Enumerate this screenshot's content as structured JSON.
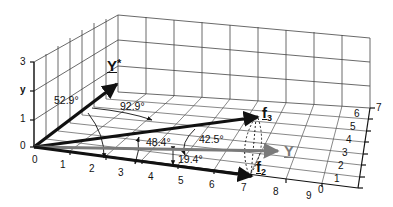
{
  "figure": {
    "type": "3d-vector-diagram",
    "y_axis": {
      "label": "y",
      "ticks": [
        "0",
        "1",
        "3"
      ]
    },
    "x_axis": {
      "ticks": [
        "0",
        "1",
        "2",
        "3",
        "4",
        "5",
        "6",
        "7",
        "8",
        "9"
      ]
    },
    "z_axis": {
      "ticks": [
        "0",
        "1",
        "2",
        "3",
        "4",
        "5",
        "6",
        "7"
      ]
    },
    "vectors": {
      "y_star": "Y*",
      "y_star_base": "Y",
      "y_star_mark": "*",
      "y": "Y",
      "f3": "f",
      "f3_sub": "3",
      "f2": "f",
      "f2_sub": "2"
    },
    "angles": {
      "a1": "52.9°",
      "a2": "92.9°",
      "a3": "48.4°",
      "a4": "42.5°",
      "a5": "19.4°"
    },
    "colors": {
      "vector_black": "#111111",
      "vector_gray": "#7a7a7a",
      "grid": "#333333"
    }
  }
}
